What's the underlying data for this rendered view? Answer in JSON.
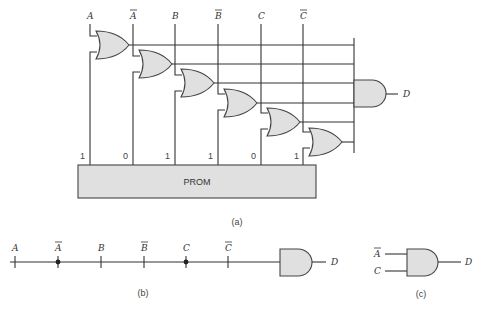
{
  "figure": {
    "part_a": {
      "caption": "(a)",
      "inputs": [
        {
          "label": "A",
          "bar": false
        },
        {
          "label": "A",
          "bar": true
        },
        {
          "label": "B",
          "bar": false
        },
        {
          "label": "B",
          "bar": true
        },
        {
          "label": "C",
          "bar": false
        },
        {
          "label": "C",
          "bar": true
        }
      ],
      "or_gate_count": 6,
      "prom_label": "PROM",
      "prom_bits": [
        "1",
        "0",
        "1",
        "1",
        "0",
        "1"
      ],
      "output_label": "D"
    },
    "part_b": {
      "caption": "(b)",
      "inputs": [
        {
          "label": "A",
          "bar": false,
          "connected": false
        },
        {
          "label": "A",
          "bar": true,
          "connected": true
        },
        {
          "label": "B",
          "bar": false,
          "connected": false
        },
        {
          "label": "B",
          "bar": true,
          "connected": false
        },
        {
          "label": "C",
          "bar": false,
          "connected": true
        },
        {
          "label": "C",
          "bar": true,
          "connected": false
        }
      ],
      "output_label": "D"
    },
    "part_c": {
      "caption": "(c)",
      "inputs": [
        {
          "label": "A",
          "bar": true
        },
        {
          "label": "C",
          "bar": false
        }
      ],
      "output_label": "D"
    }
  }
}
